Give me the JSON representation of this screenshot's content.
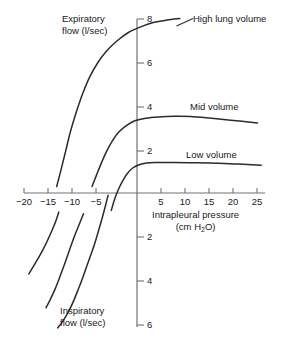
{
  "chart_data": {
    "type": "line",
    "title": "",
    "subtitle": "",
    "xlabel": "Intrapleural pressure",
    "xlabel_units": "(cm H2O)",
    "ylabel_top": "Expiratory flow (l/sec)",
    "ylabel_bottom": "Inspiratory flow (l/sec)",
    "xlim": [
      -20,
      25
    ],
    "ylim": [
      -6,
      8
    ],
    "grid": false,
    "legend_position": "inline-annotations",
    "xticks": [
      -20,
      -15,
      -10,
      -5,
      5,
      10,
      15,
      20,
      25
    ],
    "xtick_labels": [
      "−20",
      "−15",
      "−10",
      "−5",
      "5",
      "10",
      "15",
      "20",
      "25"
    ],
    "yticks": [
      8,
      6,
      4,
      2,
      -2,
      -4,
      -6
    ],
    "ytick_labels": [
      "8",
      "6",
      "4",
      "2",
      "2",
      "4",
      "6"
    ],
    "series": [
      {
        "name": "High lung volume (expiratory)",
        "label": "High lung volume",
        "points": [
          [
            -15.0,
            0.3
          ],
          [
            -14.2,
            1.05
          ],
          [
            -13.3,
            1.95
          ],
          [
            -12.4,
            2.85
          ],
          [
            -11.3,
            3.75
          ],
          [
            -10.1,
            4.6
          ],
          [
            -8.8,
            5.35
          ],
          [
            -7.3,
            6.0
          ],
          [
            -5.6,
            6.55
          ],
          [
            -3.7,
            7.0
          ],
          [
            -1.6,
            7.38
          ],
          [
            0.8,
            7.65
          ],
          [
            3.2,
            7.85
          ],
          [
            5.6,
            7.95
          ],
          [
            8.0,
            8.02
          ]
        ]
      },
      {
        "name": "Mid volume (expiratory)",
        "label": "Mid volume",
        "points": [
          [
            -8.4,
            0.3
          ],
          [
            -7.6,
            0.8
          ],
          [
            -6.7,
            1.35
          ],
          [
            -5.7,
            1.9
          ],
          [
            -4.6,
            2.4
          ],
          [
            -3.4,
            2.8
          ],
          [
            -2.0,
            3.1
          ],
          [
            -0.4,
            3.32
          ],
          [
            1.6,
            3.44
          ],
          [
            4.0,
            3.5
          ],
          [
            7.0,
            3.53
          ],
          [
            10.0,
            3.52
          ],
          [
            13.5,
            3.45
          ],
          [
            17.5,
            3.35
          ],
          [
            22.5,
            3.22
          ]
        ]
      },
      {
        "name": "Low volume (expiratory)",
        "label": "Low volume",
        "points": [
          [
            -4.8,
            -0.8
          ],
          [
            -4.2,
            -0.3
          ],
          [
            -3.5,
            0.15
          ],
          [
            -2.7,
            0.55
          ],
          [
            -1.8,
            0.9
          ],
          [
            -0.8,
            1.15
          ],
          [
            0.4,
            1.3
          ],
          [
            1.8,
            1.38
          ],
          [
            3.5,
            1.4
          ],
          [
            7.0,
            1.4
          ],
          [
            11.0,
            1.39
          ],
          [
            15.0,
            1.37
          ],
          [
            19.0,
            1.33
          ],
          [
            23.2,
            1.28
          ]
        ]
      },
      {
        "name": "High lung volume (inspiratory)",
        "points": [
          [
            -20.2,
            -3.72
          ],
          [
            -19.4,
            -3.4
          ],
          [
            -18.5,
            -3.02
          ],
          [
            -17.5,
            -2.58
          ],
          [
            -16.6,
            -2.12
          ],
          [
            -15.8,
            -1.68
          ],
          [
            -15.1,
            -1.25
          ],
          [
            -14.6,
            -0.88
          ]
        ]
      },
      {
        "name": "Mid volume (inspiratory)",
        "points": [
          [
            -17.0,
            -5.28
          ],
          [
            -16.2,
            -4.9
          ],
          [
            -15.3,
            -4.42
          ],
          [
            -14.4,
            -3.85
          ],
          [
            -13.5,
            -3.25
          ],
          [
            -12.6,
            -2.62
          ],
          [
            -11.7,
            -2.0
          ],
          [
            -10.8,
            -1.45
          ],
          [
            -10.0,
            -0.95
          ]
        ]
      },
      {
        "name": "Low volume (inspiratory)",
        "points": [
          [
            -14.8,
            -6.2
          ],
          [
            -14.0,
            -5.95
          ],
          [
            -13.0,
            -5.55
          ],
          [
            -12.0,
            -5.05
          ],
          [
            -11.0,
            -4.45
          ],
          [
            -10.0,
            -3.8
          ],
          [
            -9.0,
            -3.1
          ],
          [
            -8.0,
            -2.4
          ],
          [
            -7.2,
            -1.75
          ],
          [
            -6.5,
            -1.15
          ],
          [
            -5.9,
            -0.6
          ],
          [
            -5.4,
            -0.1
          ]
        ]
      }
    ],
    "annotations": [
      {
        "text": "High lung volume",
        "x": 10.5,
        "y": 8.1
      },
      {
        "text": "Mid volume",
        "x": 12.0,
        "y": 4.35
      },
      {
        "text": "Low volume",
        "x": 12.0,
        "y": 2.15
      }
    ]
  },
  "labels": {
    "expiratory_line1": "Expiratory",
    "expiratory_line2": "flow (l/sec)",
    "inspiratory_line1": "Inspiratory",
    "inspiratory_line2": "flow (l/sec)",
    "xaxis_line1": "Intrapleural pressure",
    "xaxis_units_pre": "(cm H",
    "xaxis_units_sub": "2",
    "xaxis_units_post": "O)",
    "high_volume": "High lung volume",
    "mid_volume": "Mid volume",
    "low_volume": "Low volume"
  },
  "ticks": {
    "x": [
      "−20",
      "−15",
      "−10",
      "−5",
      "5",
      "10",
      "15",
      "20",
      "25"
    ],
    "y_positive": [
      "8",
      "6",
      "4",
      "2"
    ],
    "y_negative": [
      "2",
      "4",
      "6"
    ]
  },
  "colors": {
    "axis": "#6f7277",
    "curve": "#2b2b2b",
    "text": "#1a1a1a",
    "background": "#ffffff"
  }
}
